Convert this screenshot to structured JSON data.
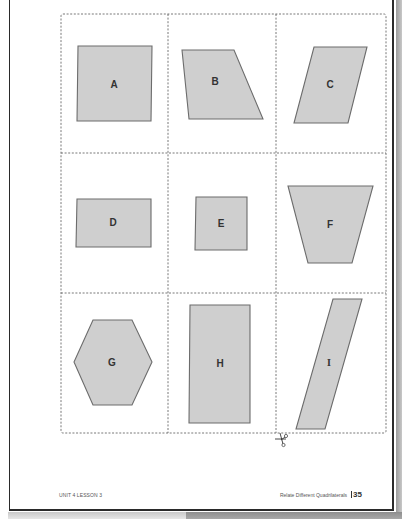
{
  "cards": [
    {
      "label": "A",
      "shape": "square"
    },
    {
      "label": "B",
      "shape": "trapezoid"
    },
    {
      "label": "C",
      "shape": "parallelogram"
    },
    {
      "label": "D",
      "shape": "rectangle"
    },
    {
      "label": "E",
      "shape": "square"
    },
    {
      "label": "F",
      "shape": "trapezoid"
    },
    {
      "label": "G",
      "shape": "hexagon"
    },
    {
      "label": "H",
      "shape": "rectangle"
    },
    {
      "label": "I",
      "shape": "parallelogram"
    }
  ],
  "cut_icon": "scissors-icon",
  "footer": {
    "left": "UNIT 4 LESSON 3",
    "right_title": "Relate Different Quadrilaterals",
    "page_number": "35"
  },
  "colors": {
    "shape_fill": "#cfcfcf",
    "shape_stroke": "#6c6c6c",
    "cut_line": "#6a6a6a"
  }
}
